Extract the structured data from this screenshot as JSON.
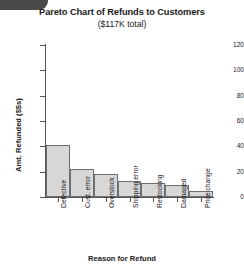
{
  "chart_data": {
    "type": "bar",
    "title": "Pareto Chart of Refunds to Customers",
    "subtitle": "($117K total)",
    "xlabel": "Reason for Refund",
    "ylabel": "Amt. Refunded ($$s)",
    "categories": [
      "Defective",
      "Cust. error",
      "Overstock",
      "Shipping error",
      "Restocking",
      "Damaged",
      "Price change"
    ],
    "values": [
      41,
      22,
      18.5,
      12.5,
      11,
      9.5,
      4.5
    ],
    "ylim": [
      0,
      120
    ],
    "yticks": [
      0,
      20,
      40,
      60,
      80,
      100,
      120
    ],
    "ytick_labels": [
      "0",
      "20",
      "40",
      "60",
      "80",
      "100",
      "120"
    ],
    "grid": false,
    "legend": "none",
    "bar_fill": "#d7d7d7",
    "bar_border": "#6e6e6e",
    "axis_color": "#555555"
  }
}
